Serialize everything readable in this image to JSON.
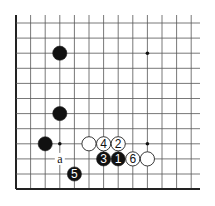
{
  "diagram": {
    "grid": {
      "origin_x": 16,
      "origin_y": 23,
      "spacing_x": 14.6,
      "spacing_y": 15.1,
      "cols": 13,
      "rows": 12,
      "right_open_to": 200,
      "top_open_from": 15,
      "line_color": "#555555",
      "edge_color": "#222222"
    },
    "star_points": [
      {
        "col": 9,
        "row": 2
      },
      {
        "col": 3,
        "row": 8
      },
      {
        "col": 9,
        "row": 8
      }
    ],
    "stones": [
      {
        "col": 3,
        "row": 2,
        "color": "black",
        "label": ""
      },
      {
        "col": 3,
        "row": 6,
        "color": "black",
        "label": ""
      },
      {
        "col": 2,
        "row": 8,
        "color": "black",
        "label": ""
      },
      {
        "col": 5,
        "row": 8,
        "color": "white",
        "label": ""
      },
      {
        "col": 6,
        "row": 8,
        "color": "white",
        "label": "4"
      },
      {
        "col": 7,
        "row": 8,
        "color": "white",
        "label": "2"
      },
      {
        "col": 6,
        "row": 9,
        "color": "black",
        "label": "3"
      },
      {
        "col": 7,
        "row": 9,
        "color": "black",
        "label": "1"
      },
      {
        "col": 8,
        "row": 9,
        "color": "white",
        "label": "6"
      },
      {
        "col": 9,
        "row": 9,
        "color": "white",
        "label": ""
      },
      {
        "col": 4,
        "row": 10,
        "color": "black",
        "label": "5"
      }
    ],
    "markers": [
      {
        "col": 3,
        "row": 9,
        "label": "a"
      }
    ]
  }
}
